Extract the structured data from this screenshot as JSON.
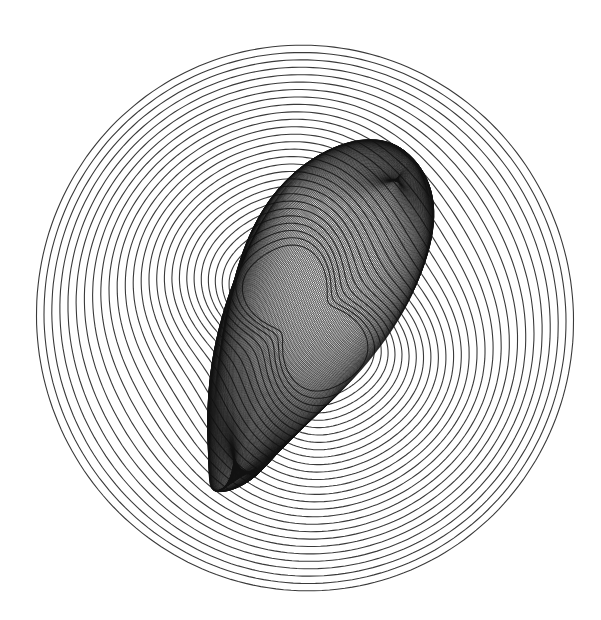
{
  "artwork": {
    "title": "Harmonograph line drawing",
    "background": "#ffffff",
    "stroke_color": "#3a3a3a",
    "dense_color": "#111111",
    "canvas": {
      "width": 601,
      "height": 620
    },
    "outer_rings": {
      "center": [
        305,
        318
      ],
      "count": 28,
      "r_outer": 268,
      "r_inner_gap": 7.2,
      "squash_y": 1.02,
      "rotation_deg": -18
    },
    "inner_form": {
      "center": [
        305,
        318
      ],
      "count": 150,
      "length": 195,
      "width_max": 78,
      "rotation_deg": -62
    }
  }
}
